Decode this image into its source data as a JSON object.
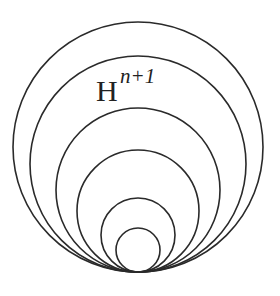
{
  "diagram": {
    "label": {
      "base": "H",
      "superscript": "n+1"
    },
    "tangent_point": [
      138,
      272
    ],
    "circles": [
      {
        "r": 125
      },
      {
        "r": 108
      },
      {
        "r": 82
      },
      {
        "r": 61
      },
      {
        "r": 37
      },
      {
        "r": 22
      }
    ],
    "stroke_color": "#2a2a2a"
  }
}
